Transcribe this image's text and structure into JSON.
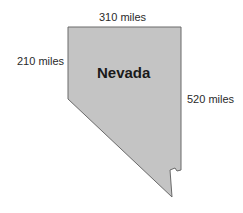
{
  "diagram": {
    "state_name": "Nevada",
    "labels": {
      "top": "310 miles",
      "left": "210 miles",
      "right": "520 miles"
    },
    "colors": {
      "fill": "#c4c4c4",
      "stroke": "#6a6a6a",
      "text": "#2a2a2a"
    }
  }
}
